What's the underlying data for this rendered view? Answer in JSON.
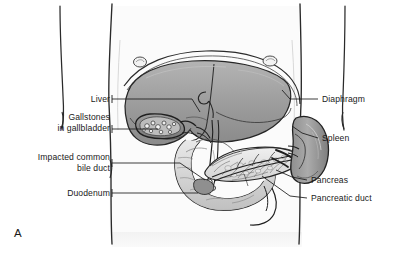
{
  "figure": {
    "panel_letter": "A",
    "background_color": "#ffffff",
    "line_color": "#1a1a1a",
    "organ_fill_mid": "#9a9a9a",
    "organ_fill_light": "#d6d6d6",
    "organ_fill_dark": "#6d6d6d"
  },
  "labels": {
    "left": [
      {
        "id": "liver",
        "text": "Liver",
        "x": 62,
        "y": 95,
        "align": "right",
        "width": 48
      },
      {
        "id": "gallstones",
        "text": "Gallstones\nin gallbladder",
        "x": 22,
        "y": 113,
        "align": "right",
        "width": 88
      },
      {
        "id": "bile-duct",
        "text": "Impacted common\nbile duct",
        "x": 8,
        "y": 153,
        "align": "right",
        "width": 102
      },
      {
        "id": "duodenum",
        "text": "Duodenum",
        "x": 48,
        "y": 189,
        "align": "right",
        "width": 62
      }
    ],
    "right": [
      {
        "id": "diaphragm",
        "text": "Diaphragm",
        "x": 322,
        "y": 95,
        "align": "left",
        "width": 70
      },
      {
        "id": "spleen",
        "text": "Spleen",
        "x": 322,
        "y": 134,
        "align": "left",
        "width": 70
      },
      {
        "id": "pancreas",
        "text": "Pancreas",
        "x": 311,
        "y": 176,
        "align": "left",
        "width": 74
      },
      {
        "id": "pancreatic-duct",
        "text": "Pancreatic duct",
        "x": 311,
        "y": 194,
        "align": "left",
        "width": 82
      }
    ]
  },
  "structures": [
    {
      "id": "torso",
      "name": "body-torso-outline"
    },
    {
      "id": "diaphragm-arch",
      "name": "diaphragm"
    },
    {
      "id": "liver",
      "name": "liver"
    },
    {
      "id": "gallbladder",
      "name": "gallbladder-with-gallstones"
    },
    {
      "id": "cystic-duct",
      "name": "cystic-duct"
    },
    {
      "id": "common-bile-duct",
      "name": "common-bile-duct"
    },
    {
      "id": "duodenum",
      "name": "duodenum"
    },
    {
      "id": "pancreas",
      "name": "pancreas"
    },
    {
      "id": "pancreatic-duct",
      "name": "pancreatic-duct"
    },
    {
      "id": "spleen",
      "name": "spleen"
    },
    {
      "id": "stomach-remnant",
      "name": "stomach"
    }
  ]
}
